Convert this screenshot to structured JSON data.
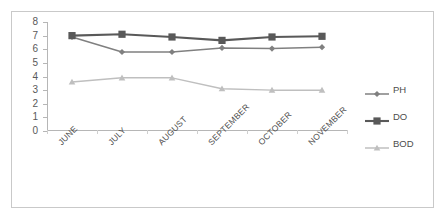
{
  "chart_data": {
    "type": "line",
    "title": "",
    "xlabel": "",
    "ylabel": "",
    "ylim": [
      0,
      8
    ],
    "ytick_step": 1,
    "yticks": [
      "0",
      "1",
      "2",
      "3",
      "4",
      "5",
      "6",
      "7",
      "8"
    ],
    "grid": false,
    "legend_position": "right",
    "categories": [
      "JUNE",
      "JULY",
      "AUGUST",
      "SEPTEMBER",
      "OCTOBER",
      "NOVEMBER"
    ],
    "series": [
      {
        "name": "PH",
        "color": "#808080",
        "marker": "diamond",
        "values": [
          6.9,
          5.8,
          5.8,
          6.1,
          6.05,
          6.15
        ]
      },
      {
        "name": "DO",
        "color": "#595959",
        "marker": "square",
        "values": [
          7.0,
          7.1,
          6.9,
          6.65,
          6.9,
          6.95
        ]
      },
      {
        "name": "BOD",
        "color": "#bfbfbf",
        "marker": "triangle",
        "values": [
          3.6,
          3.9,
          3.9,
          3.1,
          3.0,
          3.0
        ]
      }
    ]
  },
  "legend": {
    "items": [
      {
        "label": "PH"
      },
      {
        "label": "DO"
      },
      {
        "label": "BOD"
      }
    ]
  },
  "frame": {
    "border_color": "#c9c9c9"
  }
}
